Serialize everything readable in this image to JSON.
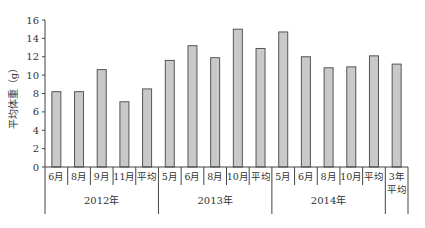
{
  "chart_data": {
    "type": "bar",
    "title": "",
    "xlabel": "",
    "ylabel": "平均体重（g）",
    "ylim": [
      0,
      16
    ],
    "yticks": [
      0,
      2,
      4,
      6,
      8,
      10,
      12,
      14,
      16
    ],
    "grid": false,
    "legend": null,
    "categories": [
      "6月",
      "8月",
      "9月",
      "11月",
      "平均",
      "5月",
      "6月",
      "8月",
      "10月",
      "平均",
      "5月",
      "6月",
      "8月",
      "10月",
      "平均",
      "3年平均"
    ],
    "groups": [
      {
        "label": "2012年",
        "start": 0,
        "count": 5
      },
      {
        "label": "2013年",
        "start": 5,
        "count": 5
      },
      {
        "label": "2014年",
        "start": 10,
        "count": 5
      },
      {
        "label": "",
        "start": 15,
        "count": 1
      }
    ],
    "values": [
      8.2,
      8.2,
      10.6,
      7.1,
      8.5,
      11.6,
      13.2,
      11.9,
      15.0,
      12.9,
      14.7,
      12.0,
      10.8,
      10.9,
      12.1,
      11.2
    ]
  },
  "style": {
    "bar_fill": "#c9c9c9",
    "bar_stroke": "#555555",
    "axis_color": "#444444"
  }
}
